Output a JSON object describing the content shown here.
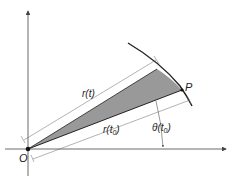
{
  "diagram": {
    "type": "polar-area-sector",
    "labels": {
      "origin": "O",
      "point": "P",
      "r_t": "r(t)",
      "r_t0_prefix": "r(t",
      "r_t0_sub": "0",
      "r_t0_suffix": ")",
      "theta_prefix": "θ(t",
      "theta_sub": "0",
      "theta_suffix": ")"
    },
    "colors": {
      "line": "#222222",
      "shade": "#999999",
      "axis": "#444444",
      "dimension": "#555555",
      "background": "#ffffff"
    },
    "elements": [
      "x-axis",
      "y-axis",
      "polar curve arc",
      "shaded sector between r(t0) and r(t)",
      "dimension line r(t)",
      "dimension line r(t0)",
      "angle arrow θ(t0)",
      "origin dot O",
      "point P"
    ]
  }
}
